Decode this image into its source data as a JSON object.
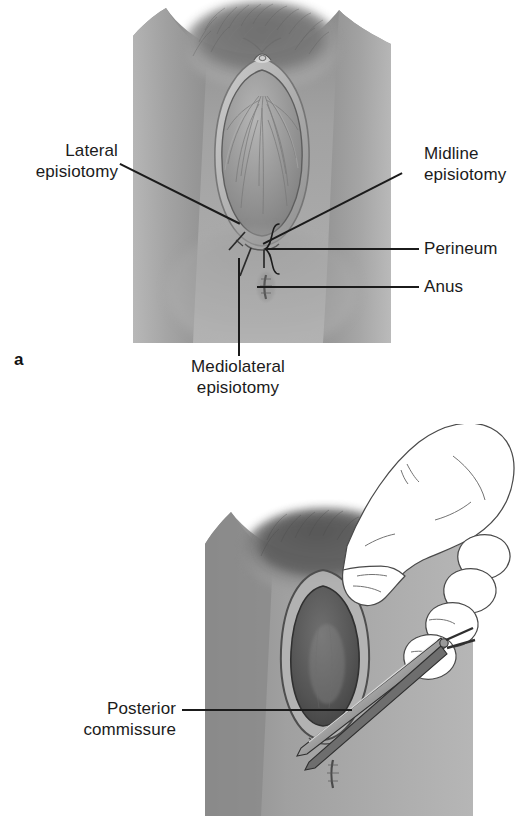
{
  "figure": {
    "style": "grayscale medical line-and-tone illustration"
  },
  "panels": [
    {
      "letter": "a",
      "name": "episiotomy-types",
      "caption_labels": [
        "Lateral episiotomy",
        "Mediolateral episiotomy",
        "Midline episiotomy",
        "Perineum",
        "Anus"
      ]
    },
    {
      "letter": "",
      "name": "mediolateral-incision",
      "caption_labels": [
        "Posterior commissure"
      ]
    }
  ],
  "labels": {
    "lateral_episiotomy": "Lateral\nepisiotomy",
    "midline_episiotomy": "Midline\nepisiotomy",
    "mediolateral_episiotomy": "Mediolateral\nepisiotomy",
    "perineum": "Perineum",
    "anus": "Anus",
    "posterior_commissure": "Posterior\ncommissure",
    "panel_a_letter": "a"
  },
  "colors": {
    "ink": "#1b1b1b",
    "background": "#ffffff",
    "skin_mid": "#9a9a9a",
    "skin_light": "#c9c9c9",
    "skin_dark": "#6e6e6e",
    "skin_deep": "#3f3f3f",
    "introitus_dark": "#555555",
    "glove_outline": "#4a4a4a",
    "instrument_steel": "#8f8f8f"
  }
}
